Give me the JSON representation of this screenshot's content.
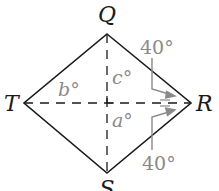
{
  "diagram": {
    "type": "rhombus-with-diagonals",
    "vertices": {
      "Q": {
        "label": "Q",
        "x": 107,
        "y": 34
      },
      "R": {
        "label": "R",
        "x": 191,
        "y": 103
      },
      "S": {
        "label": "S",
        "x": 107,
        "y": 173
      },
      "T": {
        "label": "T",
        "x": 24,
        "y": 103
      }
    },
    "angle_labels": {
      "a": "a°",
      "b": "b°",
      "c": "c°"
    },
    "given_angles": {
      "top": "40°",
      "bottom": "40°"
    },
    "colors": {
      "lines": "#1a1a1a",
      "annotations": "#8a8a8a",
      "background": "#ffffff"
    }
  }
}
